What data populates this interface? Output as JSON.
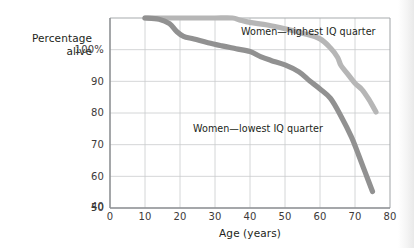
{
  "chart_data": {
    "type": "line",
    "title": "",
    "xlabel": "Age (years)",
    "ylabel": "Percentage alive",
    "xlim": [
      0,
      80
    ],
    "ylim": [
      40,
      100
    ],
    "grid": true,
    "legend_position": "inline-annotations",
    "xticks": [
      "0",
      "10",
      "20",
      "30",
      "40",
      "50",
      "60",
      "70",
      "80"
    ],
    "xtick_values": [
      0,
      10,
      20,
      30,
      40,
      50,
      60,
      70,
      80
    ],
    "yticks": [
      "40",
      "50",
      "60",
      "70",
      "80",
      "90",
      "100%"
    ],
    "ytick_values": [
      40,
      50,
      60,
      70,
      80,
      90,
      100
    ],
    "series": [
      {
        "name": "Women—highest IQ quarter",
        "color": "#b6b6b6",
        "x": [
          10,
          15,
          20,
          25,
          30,
          35,
          37,
          40,
          45,
          50,
          55,
          60,
          63,
          65,
          66,
          68,
          70,
          72,
          74,
          76
        ],
        "values": [
          100,
          100,
          100,
          100,
          100,
          100,
          99.4,
          98.6,
          97.8,
          96.6,
          95.2,
          93.4,
          90.5,
          87.6,
          85.0,
          82.2,
          79.4,
          77.4,
          74.2,
          70.3
        ]
      },
      {
        "name": "Women—lowest IQ quarter",
        "color": "#919191",
        "x": [
          10,
          14,
          17,
          19,
          21,
          24,
          28,
          32,
          36,
          40,
          43,
          46,
          50,
          54,
          57,
          60,
          63,
          66,
          69,
          71,
          73,
          75
        ],
        "values": [
          100,
          99.6,
          98.2,
          95.8,
          94.2,
          93.4,
          92.2,
          91.2,
          90.3,
          89.4,
          87.8,
          86.6,
          85.2,
          83.0,
          80.2,
          77.6,
          74.6,
          69.0,
          62.4,
          56.8,
          51.0,
          45.2
        ]
      }
    ],
    "annotations": [
      {
        "text": "Women—highest IQ quarter",
        "x": 44,
        "y": 97.5
      },
      {
        "text": "Women—lowest IQ quarter",
        "x": 32,
        "y": 67.5
      }
    ]
  },
  "style": {
    "plot_background": "#ffffff",
    "grid_color": "#c9cbcd",
    "axis_color": "#9a9da0",
    "text_color": "#231f20",
    "tick_color": "#3d3a39"
  }
}
